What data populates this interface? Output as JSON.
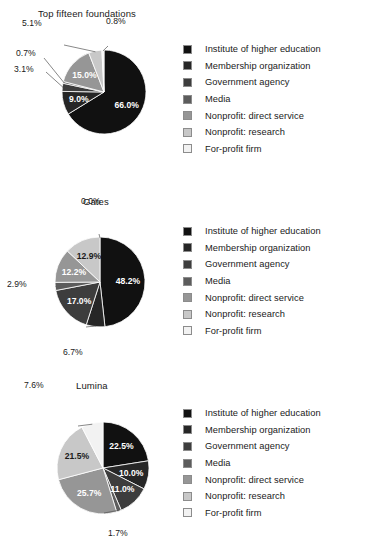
{
  "palette": {
    "institute_of_higher_education": "#111111",
    "membership_organization": "#262626",
    "government_agency": "#3d3d3d",
    "media": "#5c5c5c",
    "nonprofit_direct_service": "#969696",
    "nonprofit_research": "#c8c8c8",
    "for_profit_firm": "#f2f2f2",
    "swatch_border": "#8c8c8c",
    "leader_line": "#555555",
    "text": "#1a1a1a",
    "background": "#ffffff"
  },
  "legend": {
    "items": [
      {
        "label": "Institute of higher education",
        "color": "#111111"
      },
      {
        "label": "Membership organization",
        "color": "#262626"
      },
      {
        "label": "Government agency",
        "color": "#3d3d3d"
      },
      {
        "label": "Media",
        "color": "#5c5c5c"
      },
      {
        "label": "Nonprofit: direct service",
        "color": "#969696"
      },
      {
        "label": "Nonprofit: research",
        "color": "#c8c8c8"
      },
      {
        "label": "For-profit firm",
        "color": "#f2f2f2"
      }
    ]
  },
  "chart_data": [
    {
      "type": "pie",
      "title": "Top fifteen foundations",
      "categories": [
        "Institute of higher education",
        "Membership organization",
        "Government agency",
        "Media",
        "Nonprofit: direct service",
        "Nonprofit: research",
        "For-profit firm"
      ],
      "values": [
        66.0,
        9.0,
        3.1,
        0.7,
        15.0,
        5.1,
        0.8
      ],
      "labels": [
        "66.0%",
        "9.0%",
        "3.1%",
        "0.7%",
        "15.0%",
        "5.1%",
        "0.8%"
      ],
      "label_placement": [
        "inside",
        "inside",
        "outside",
        "outside",
        "inside",
        "outside",
        "outside"
      ],
      "start_angle_deg": 0,
      "direction": "clockwise",
      "legend_position": "right",
      "grid": false
    },
    {
      "type": "pie",
      "title": "Gates",
      "categories": [
        "Institute of higher education",
        "Membership organization",
        "Government agency",
        "Media",
        "Nonprofit: direct service",
        "Nonprofit: research",
        "For-profit firm"
      ],
      "values": [
        48.2,
        6.7,
        17.0,
        2.9,
        12.2,
        12.9,
        0.0
      ],
      "labels": [
        "48.2%",
        "6.7%",
        "17.0%",
        "2.9%",
        "12.2%",
        "12.9%",
        "0.0%"
      ],
      "label_placement": [
        "inside",
        "outside",
        "inside",
        "outside",
        "inside",
        "inside",
        "outside"
      ],
      "start_angle_deg": 0,
      "direction": "clockwise",
      "legend_position": "right",
      "grid": false
    },
    {
      "type": "pie",
      "title": "Lumina",
      "categories": [
        "Institute of higher education",
        "Membership organization",
        "Government agency",
        "Media",
        "Nonprofit: direct service",
        "Nonprofit: research",
        "For-profit firm"
      ],
      "values": [
        22.5,
        10.0,
        11.0,
        1.7,
        25.7,
        21.5,
        7.6
      ],
      "labels": [
        "22.5%",
        "10.0%",
        "11.0%",
        "1.7%",
        "25.7%",
        "21.5%",
        "7.6%"
      ],
      "label_placement": [
        "inside",
        "inside",
        "inside",
        "outside",
        "inside",
        "inside",
        "outside"
      ],
      "start_angle_deg": 0,
      "direction": "clockwise",
      "legend_position": "right",
      "grid": false
    }
  ]
}
